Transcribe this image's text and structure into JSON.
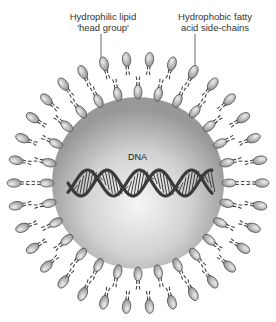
{
  "diagram": {
    "labels": {
      "head_group": [
        "Hydrophilic lipid",
        "'head group'"
      ],
      "tails": [
        "Hydrophobic fatty",
        "acid side-chains"
      ],
      "dna": "DNA"
    },
    "geometry": {
      "center": [
        138,
        183
      ],
      "core_radius": 86,
      "inner_head_radius": 91,
      "outer_head_radius": 124,
      "outer_head_count": 34,
      "inner_head_count": 28
    },
    "colors": {
      "background": "#ffffff",
      "core_light": "#f4f4f4",
      "core_dark": "#9a9a9a",
      "head_fill": "#b8b8b8",
      "head_stroke": "#555555",
      "tail": "#444444",
      "dna": "#3a3a3a"
    }
  }
}
